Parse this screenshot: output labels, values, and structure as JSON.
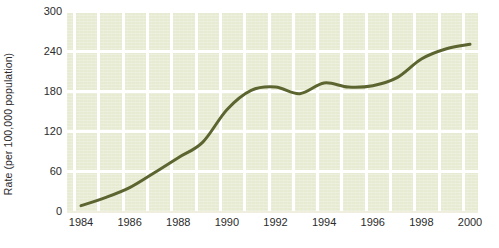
{
  "chart_data": {
    "type": "line",
    "title": "",
    "subtitle": "",
    "xlabel": "",
    "ylabel": "Rate (per 100,000 population)",
    "xlim": [
      1984,
      2000
    ],
    "ylim": [
      0,
      300
    ],
    "y_ticks": [
      0,
      60,
      120,
      180,
      240,
      300
    ],
    "y_tick_labels": [
      "0",
      "60",
      "120",
      "180",
      "240",
      "300"
    ],
    "x_ticks": [
      1984,
      1986,
      1988,
      1990,
      1992,
      1994,
      1996,
      1998,
      2000
    ],
    "x_tick_labels": [
      "1984",
      "1986",
      "1988",
      "1990",
      "1992",
      "1994",
      "1996",
      "1998",
      "2000"
    ],
    "grid": true,
    "grid_color": "#ffffff",
    "plot_background": "#e6ebd2",
    "page_background": "#ffffff",
    "legend": null,
    "legend_position": "none",
    "annotations": [],
    "series": [
      {
        "name": "Rate",
        "color": "#5c6430",
        "line_width": 3,
        "markers": false,
        "x": [
          1984,
          1985,
          1986,
          1987,
          1988,
          1989,
          1990,
          1991,
          1992,
          1993,
          1994,
          1995,
          1996,
          1997,
          1998,
          1999,
          2000
        ],
        "values": [
          8,
          20,
          35,
          57,
          80,
          103,
          152,
          181,
          186,
          176,
          192,
          186,
          188,
          200,
          228,
          243,
          250
        ]
      }
    ]
  }
}
